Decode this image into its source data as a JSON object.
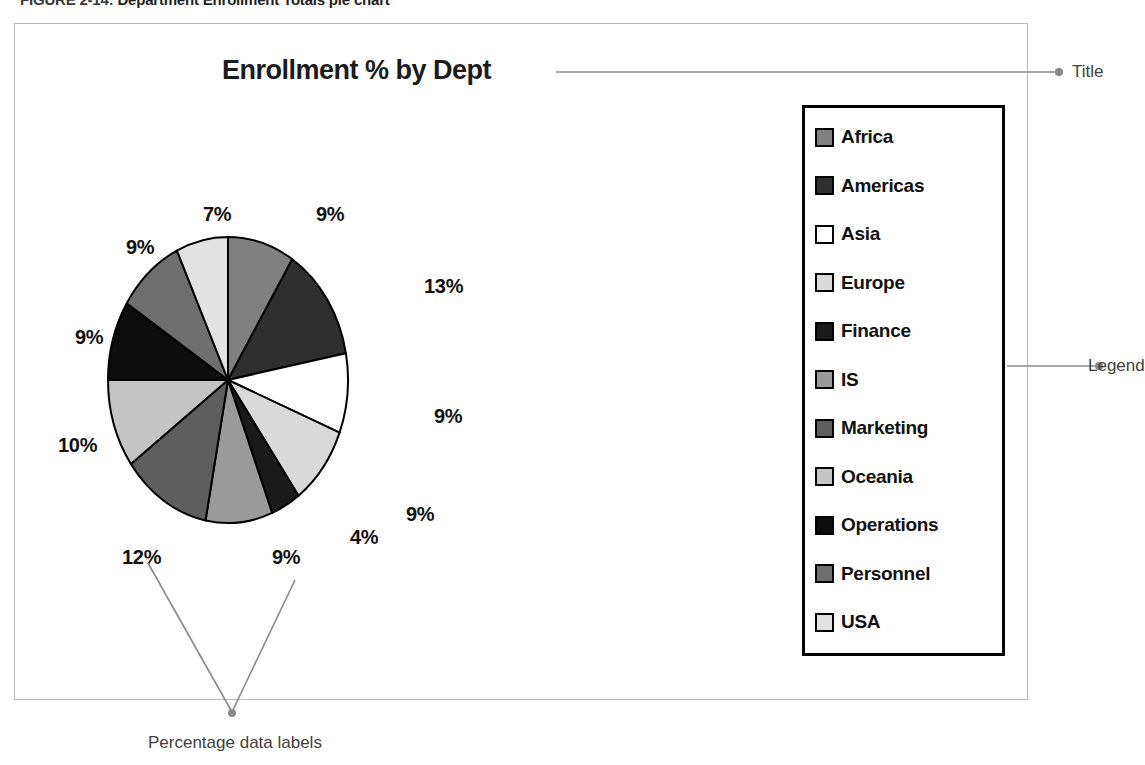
{
  "figure": {
    "caption_number": "FIGURE 2-14:",
    "caption_text": "Department Enrollment Totals pie chart"
  },
  "chart": {
    "title": "Enrollment % by Dept"
  },
  "annotations": {
    "title_label": "Title",
    "legend_label": "Legend",
    "data_labels_label": "Percentage data labels"
  },
  "legend": {
    "entries": [
      {
        "label": "Africa",
        "color": "#808080"
      },
      {
        "label": "Americas",
        "color": "#2f2f2f"
      },
      {
        "label": "Asia",
        "color": "#ffffff"
      },
      {
        "label": "Europe",
        "color": "#d9d9d9"
      },
      {
        "label": "Finance",
        "color": "#1a1a1a"
      },
      {
        "label": "IS",
        "color": "#9a9a9a"
      },
      {
        "label": "Marketing",
        "color": "#5e5e5e"
      },
      {
        "label": "Oceania",
        "color": "#c4c4c4"
      },
      {
        "label": "Operations",
        "color": "#0d0d0d"
      },
      {
        "label": "Personnel",
        "color": "#6e6e6e"
      },
      {
        "label": "USA",
        "color": "#e2e2e2"
      }
    ]
  },
  "chart_data": {
    "type": "pie",
    "title": "Enrollment % by Dept",
    "legend_position": "right",
    "categories": [
      "Africa",
      "Americas",
      "Asia",
      "Europe",
      "Finance",
      "IS",
      "Marketing",
      "Oceania",
      "Operations",
      "Personnel",
      "USA"
    ],
    "values": [
      9,
      13,
      9,
      9,
      4,
      9,
      12,
      10,
      9,
      9,
      7
    ],
    "value_unit": "%",
    "data_labels": [
      "9%",
      "13%",
      "9%",
      "9%",
      "4%",
      "9%",
      "12%",
      "10%",
      "9%",
      "9%",
      "7%"
    ],
    "colors": [
      "#808080",
      "#2f2f2f",
      "#ffffff",
      "#d9d9d9",
      "#1a1a1a",
      "#9a9a9a",
      "#5e5e5e",
      "#c4c4c4",
      "#0d0d0d",
      "#6e6e6e",
      "#e2e2e2"
    ],
    "slices": [
      {
        "label": "Africa",
        "value": 9,
        "data_label": "9%",
        "color": "#808080"
      },
      {
        "label": "Americas",
        "value": 13,
        "data_label": "13%",
        "color": "#2f2f2f"
      },
      {
        "label": "Asia",
        "value": 9,
        "data_label": "9%",
        "color": "#ffffff"
      },
      {
        "label": "Europe",
        "value": 9,
        "data_label": "9%",
        "color": "#d9d9d9"
      },
      {
        "label": "Finance",
        "value": 4,
        "data_label": "4%",
        "color": "#1a1a1a"
      },
      {
        "label": "IS",
        "value": 9,
        "data_label": "9%",
        "color": "#9a9a9a"
      },
      {
        "label": "Marketing",
        "value": 12,
        "data_label": "12%",
        "color": "#5e5e5e"
      },
      {
        "label": "Oceania",
        "value": 10,
        "data_label": "10%",
        "color": "#c4c4c4"
      },
      {
        "label": "Operations",
        "value": 9,
        "data_label": "9%",
        "color": "#0d0d0d"
      },
      {
        "label": "Personnel",
        "value": 9,
        "data_label": "9%",
        "color": "#6e6e6e"
      },
      {
        "label": "USA",
        "value": 7,
        "data_label": "7%",
        "color": "#e2e2e2"
      }
    ]
  }
}
